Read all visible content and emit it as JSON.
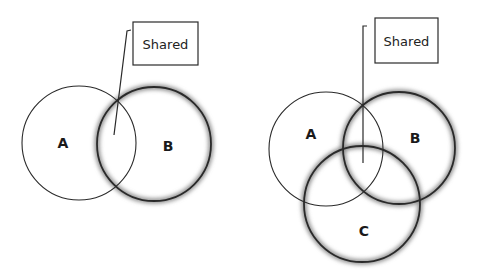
{
  "diagrams": [
    {
      "name": "two-set-venn",
      "callout": {
        "label": "Shared",
        "box": [
          133,
          22,
          65,
          43
        ],
        "line": [
          [
            131,
            30
          ],
          [
            127,
            31
          ],
          [
            114,
            135
          ]
        ]
      },
      "circles": [
        {
          "label": "A",
          "cx": 79,
          "cy": 143,
          "r": 57,
          "highlighted": false,
          "label_pos": [
            63,
            148
          ]
        },
        {
          "label": "B",
          "cx": 154,
          "cy": 144,
          "r": 57,
          "highlighted": true,
          "label_pos": [
            168,
            151
          ]
        }
      ]
    },
    {
      "name": "three-set-venn",
      "callout": {
        "label": "Shared",
        "box": [
          375,
          18,
          63,
          45
        ],
        "line": [
          [
            367,
            26
          ],
          [
            363,
            26
          ],
          [
            363,
            163
          ]
        ]
      },
      "circles": [
        {
          "label": "A",
          "cx": 326,
          "cy": 149,
          "r": 57,
          "highlighted": false,
          "label_pos": [
            311,
            139
          ]
        },
        {
          "label": "B",
          "cx": 399,
          "cy": 148,
          "r": 56,
          "highlighted": true,
          "label_pos": [
            415,
            143
          ]
        },
        {
          "label": "C",
          "cx": 362,
          "cy": 204,
          "r": 58,
          "highlighted": true,
          "label_pos": [
            364,
            236
          ]
        }
      ]
    }
  ],
  "colors": {
    "stroke": "#2a2a2a",
    "glow": "#8a8a8a",
    "background": "#ffffff"
  }
}
